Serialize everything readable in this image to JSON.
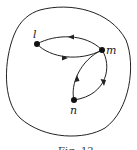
{
  "figure": {
    "caption": "Fig. 12",
    "nodes": [
      {
        "id": "l",
        "label": "l",
        "x": 37,
        "y": 44
      },
      {
        "id": "m",
        "label": "m",
        "x": 102,
        "y": 50
      },
      {
        "id": "n",
        "label": "n",
        "x": 74,
        "y": 100
      }
    ],
    "edges": [
      {
        "from": "m",
        "to": "l",
        "direction": "arrow-left",
        "position": "upper"
      },
      {
        "from": "l",
        "to": "m",
        "direction": "arrow-right",
        "position": "lower"
      },
      {
        "from": "n",
        "to": "m",
        "direction": "arrow-up",
        "position": "left"
      },
      {
        "from": "m",
        "to": "n",
        "direction": "arrow-down",
        "position": "right"
      }
    ],
    "boundary": "closed-curve",
    "colors": {
      "stroke": "#222222",
      "background": "#ffffff"
    }
  }
}
